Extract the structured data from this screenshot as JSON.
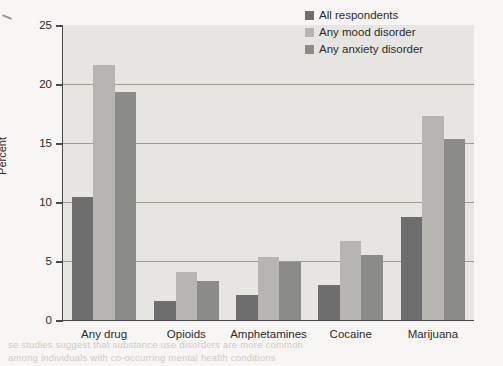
{
  "chart_data": {
    "type": "bar",
    "title": "",
    "xlabel": "",
    "ylabel": "Percent",
    "ylim": [
      0,
      25
    ],
    "yticks": [
      0,
      5,
      10,
      15,
      20,
      25
    ],
    "grid": true,
    "legend_position": "top-right",
    "categories": [
      "Any drug",
      "Opioids",
      "Amphetamines",
      "Cocaine",
      "Marijuana"
    ],
    "series": [
      {
        "name": "All respondents",
        "color": "#6e6e6e",
        "values": [
          10.4,
          1.6,
          2.1,
          3.0,
          8.7
        ]
      },
      {
        "name": "Any mood disorder",
        "color": "#b6b5b1",
        "values": [
          21.6,
          4.1,
          5.3,
          6.7,
          17.3
        ]
      },
      {
        "name": "Any anxiety disorder",
        "color": "#8b8b88",
        "values": [
          19.3,
          3.3,
          4.9,
          5.5,
          15.3
        ]
      }
    ]
  },
  "yticks": {
    "t0": "0",
    "t1": "5",
    "t2": "10",
    "t3": "15",
    "t4": "20",
    "t5": "25"
  },
  "axis": {
    "y_title": "Percent"
  },
  "xlabels": {
    "c0": "Any drug",
    "c1": "Opioids",
    "c2": "Amphetamines",
    "c3": "Cocaine",
    "c4": "Marijuana"
  },
  "legend": {
    "item0": "All respondents",
    "item1": "Any mood disorder",
    "item2": "Any anxiety disorder"
  },
  "page_bleed": {
    "line1": "se studies suggest that substance use disorders are more common",
    "line2": "among individuals with co-occurring mental health conditions"
  }
}
